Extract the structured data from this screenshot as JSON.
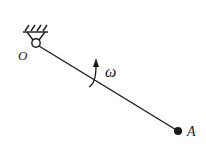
{
  "diagram": {
    "type": "rotating-rod",
    "pivot": {
      "label": "O",
      "x": 36,
      "y": 43
    },
    "endpoint": {
      "label": "A",
      "x": 178,
      "y": 131
    },
    "angular_velocity": {
      "symbol": "ω"
    },
    "colors": {
      "stroke": "#1a1a1a",
      "background": "#ffffff"
    }
  }
}
